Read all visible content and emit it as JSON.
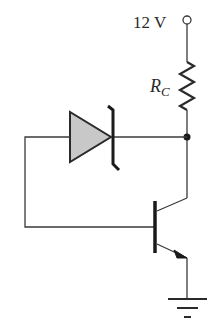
{
  "diagram": {
    "type": "circuit-schematic",
    "supply": {
      "label": "12 V"
    },
    "resistor": {
      "label_main": "R",
      "label_sub": "C"
    },
    "components": [
      "12 V supply terminal",
      "collector resistor R_C",
      "zener diode",
      "NPN transistor",
      "ground"
    ],
    "colors": {
      "wire": "#3a3a3a",
      "diode_fill": "#c8c8c8",
      "background": "#ffffff"
    }
  }
}
